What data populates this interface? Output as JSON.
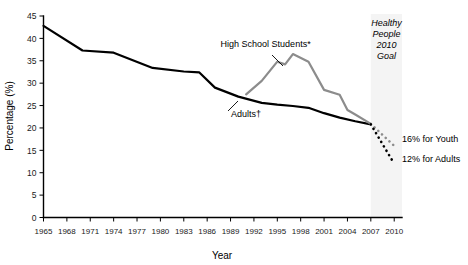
{
  "chart_data": {
    "type": "line",
    "title": "",
    "xlabel": "Year",
    "ylabel": "Percentage (%)",
    "xlim": [
      1965,
      2011
    ],
    "ylim": [
      0,
      45
    ],
    "ytick_step": 5,
    "yticks": [
      0,
      5,
      10,
      15,
      20,
      25,
      30,
      35,
      40,
      45
    ],
    "xticks": [
      1965,
      1968,
      1971,
      1974,
      1977,
      1980,
      1983,
      1986,
      1989,
      1992,
      1995,
      1998,
      2001,
      2004,
      2007,
      2010
    ],
    "xtick_labels": [
      "1965",
      "1968",
      "1971",
      "1974",
      "1977",
      "1980",
      "1983",
      "1986",
      "1989",
      "1992",
      "1995",
      "1998",
      "2001",
      "2004",
      "2007",
      "2010"
    ],
    "ytick_labels": [
      "0",
      "5",
      "10",
      "15",
      "20",
      "25",
      "30",
      "35",
      "40",
      "45"
    ],
    "grid": false,
    "legend_position": "inline-annotations",
    "series": [
      {
        "name": "Adults†",
        "color": "#000000",
        "style": "solid",
        "x": [
          1965,
          1970,
          1974,
          1979,
          1983,
          1985,
          1987,
          1990,
          1993,
          1995,
          1997,
          1999,
          2001,
          2003,
          2005,
          2007
        ],
        "values": [
          42.8,
          37.3,
          36.8,
          33.4,
          32.6,
          32.4,
          29.0,
          27.0,
          25.6,
          25.2,
          24.9,
          24.5,
          23.3,
          22.3,
          21.5,
          20.8
        ]
      },
      {
        "name": "High School Students*",
        "color": "#8c8c8c",
        "style": "solid",
        "x": [
          1991,
          1993,
          1995,
          1996,
          1997,
          1999,
          2001,
          2003,
          2004,
          2005,
          2007
        ],
        "values": [
          27.5,
          30.5,
          34.8,
          34.2,
          36.5,
          34.8,
          28.5,
          27.4,
          24.0,
          23.0,
          20.9
        ]
      },
      {
        "name": "16% for Youth",
        "color": "#8c8c8c",
        "style": "dotted",
        "x": [
          2007,
          2010
        ],
        "values": [
          20.9,
          16.0
        ]
      },
      {
        "name": "12% for Adults",
        "color": "#000000",
        "style": "dotted",
        "x": [
          2007,
          2010
        ],
        "values": [
          20.8,
          12.0
        ]
      }
    ],
    "annotations": [
      {
        "text": "High School Students*",
        "x": 1993.5,
        "y": 38.0,
        "role": "series-callout"
      },
      {
        "text": "Adults†",
        "x": 1991.0,
        "y": 22.5,
        "role": "series-callout"
      },
      {
        "text": "16% for Youth",
        "x": 2010.5,
        "y": 16.8,
        "role": "target-callout"
      },
      {
        "text": "12% for Adults",
        "x": 2010.5,
        "y": 12.4,
        "role": "target-callout"
      }
    ],
    "goal_band": {
      "label_lines": [
        "Healthy",
        "People",
        "2010",
        "Goal"
      ],
      "x_start": 2007,
      "x_end": 2011,
      "fill": "#f4f4f4"
    }
  },
  "axes": {
    "y_title": "Percentage (%)",
    "x_title": "Year"
  },
  "colors": {
    "adults": "#000000",
    "students": "#8c8c8c",
    "band": "#f4f4f4",
    "axis": "#000000"
  }
}
